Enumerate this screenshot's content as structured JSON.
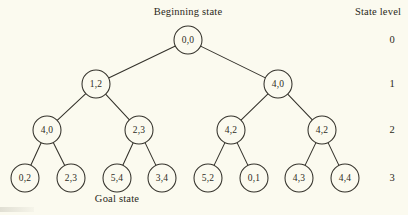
{
  "figure": {
    "background_color": "#fbfaef",
    "ink_color": "#33312a",
    "beginning_label": "Beginning state",
    "goal_label": "Goal state",
    "state_level_header": "State level"
  },
  "levels": [
    {
      "number": "0",
      "y": 40
    },
    {
      "number": "1",
      "y": 84
    },
    {
      "number": "2",
      "y": 130
    },
    {
      "number": "3",
      "y": 178
    }
  ],
  "nodes": [
    {
      "id": "n0",
      "label": "0,0",
      "level": 0,
      "x": 188,
      "y": 40,
      "r": 14
    },
    {
      "id": "n1",
      "label": "1,2",
      "level": 1,
      "x": 96,
      "y": 84,
      "r": 14
    },
    {
      "id": "n2",
      "label": "4,0",
      "level": 1,
      "x": 278,
      "y": 84,
      "r": 14
    },
    {
      "id": "n3",
      "label": "4,0",
      "level": 2,
      "x": 47,
      "y": 130,
      "r": 14
    },
    {
      "id": "n4",
      "label": "2,3",
      "level": 2,
      "x": 139,
      "y": 130,
      "r": 14
    },
    {
      "id": "n5",
      "label": "4,2",
      "level": 2,
      "x": 231,
      "y": 130,
      "r": 14
    },
    {
      "id": "n6",
      "label": "4,2",
      "level": 2,
      "x": 322,
      "y": 130,
      "r": 14
    },
    {
      "id": "n7",
      "label": "0,2",
      "level": 3,
      "x": 25,
      "y": 178,
      "r": 14
    },
    {
      "id": "n8",
      "label": "2,3",
      "level": 3,
      "x": 71,
      "y": 178,
      "r": 14
    },
    {
      "id": "n9",
      "label": "5,4",
      "level": 3,
      "x": 117,
      "y": 178,
      "r": 14
    },
    {
      "id": "n10",
      "label": "3,4",
      "level": 3,
      "x": 162,
      "y": 178,
      "r": 14
    },
    {
      "id": "n11",
      "label": "5,2",
      "level": 3,
      "x": 208,
      "y": 178,
      "r": 14
    },
    {
      "id": "n12",
      "label": "0,1",
      "level": 3,
      "x": 254,
      "y": 178,
      "r": 14
    },
    {
      "id": "n13",
      "label": "4,3",
      "level": 3,
      "x": 299,
      "y": 178,
      "r": 14
    },
    {
      "id": "n14",
      "label": "4,4",
      "level": 3,
      "x": 345,
      "y": 178,
      "r": 14
    }
  ],
  "edges": [
    {
      "from": "n0",
      "to": "n1"
    },
    {
      "from": "n0",
      "to": "n2"
    },
    {
      "from": "n1",
      "to": "n3"
    },
    {
      "from": "n1",
      "to": "n4"
    },
    {
      "from": "n2",
      "to": "n5"
    },
    {
      "from": "n2",
      "to": "n6"
    },
    {
      "from": "n3",
      "to": "n7"
    },
    {
      "from": "n3",
      "to": "n8"
    },
    {
      "from": "n4",
      "to": "n9"
    },
    {
      "from": "n4",
      "to": "n10"
    },
    {
      "from": "n5",
      "to": "n11"
    },
    {
      "from": "n5",
      "to": "n12"
    },
    {
      "from": "n6",
      "to": "n13"
    },
    {
      "from": "n6",
      "to": "n14"
    }
  ],
  "annotations": {
    "beginning_state": {
      "text": "Beginning state",
      "x": 188,
      "y": 6
    },
    "goal_state": {
      "text": "Goal state",
      "x": 117,
      "y": 193
    },
    "state_level": {
      "text": "State level",
      "x": 378,
      "y": 6
    },
    "level_x": 392
  }
}
